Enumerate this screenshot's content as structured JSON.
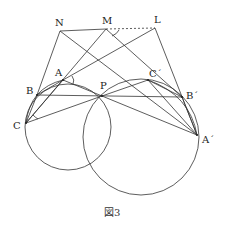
{
  "figure": {
    "caption": "図3",
    "points": {
      "N": {
        "label": "N",
        "x": 60,
        "y": 31
      },
      "M": {
        "label": "M",
        "x": 106,
        "y": 29
      },
      "L": {
        "label": "L",
        "x": 155,
        "y": 28
      },
      "A": {
        "label": "A",
        "x": 63,
        "y": 80
      },
      "B": {
        "label": "B",
        "x": 37,
        "y": 95
      },
      "C": {
        "label": "C",
        "x": 26,
        "y": 123
      },
      "P": {
        "label": "P",
        "x": 102,
        "y": 96
      },
      "C2": {
        "label": "C´",
        "x": 148,
        "y": 80
      },
      "B2": {
        "label": "B´",
        "x": 182,
        "y": 97
      },
      "A2": {
        "label": "A´",
        "x": 197,
        "y": 135
      }
    },
    "circles": [
      {
        "name": "small-circle",
        "cx": 68,
        "cy": 127,
        "r": 43
      },
      {
        "name": "large-circle",
        "cx": 141,
        "cy": 137,
        "r": 58
      }
    ],
    "stroke_color": "#333333"
  }
}
